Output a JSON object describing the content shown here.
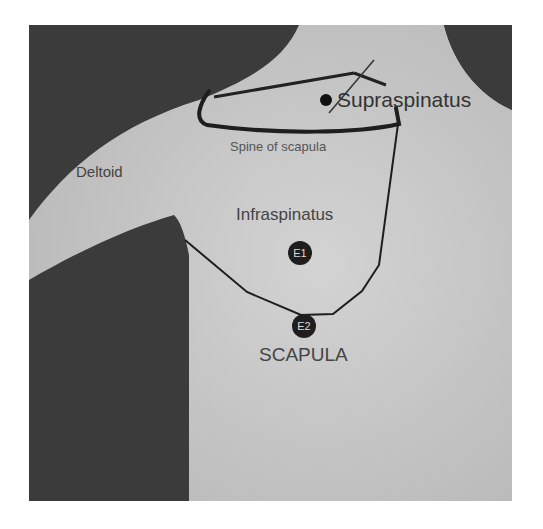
{
  "figure": {
    "labels": {
      "supraspinatus": "Supraspinatus",
      "spine_of_scapula": "Spine of scapula",
      "deltoid": "Deltoid",
      "infraspinatus": "Infraspinatus",
      "scapula": "SCAPULA"
    },
    "electrodes": [
      {
        "label": "E1"
      },
      {
        "label": "E2"
      }
    ],
    "colors": {
      "background": "#3a3a3a",
      "skin": "#c9c9c9",
      "outline": "#1e1e1e",
      "text": "#3a3a3a"
    }
  }
}
